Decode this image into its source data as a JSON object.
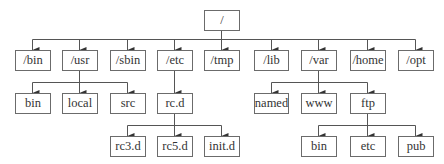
{
  "diagram": {
    "type": "directory-tree",
    "colors": {
      "line": "#555555",
      "border": "#6b6b6b",
      "text": "#333333",
      "background": "#ffffff"
    },
    "root": {
      "label": "/"
    },
    "level1": [
      {
        "id": "bin",
        "label": "/bin"
      },
      {
        "id": "usr",
        "label": "/usr"
      },
      {
        "id": "sbin",
        "label": "/sbin"
      },
      {
        "id": "etc",
        "label": "/etc"
      },
      {
        "id": "tmp",
        "label": "/tmp"
      },
      {
        "id": "lib",
        "label": "/lib"
      },
      {
        "id": "var",
        "label": "/var"
      },
      {
        "id": "home",
        "label": "/home"
      },
      {
        "id": "opt",
        "label": "/opt"
      }
    ],
    "level2": [
      {
        "id": "usr-bin",
        "label": "bin",
        "parent": "/usr"
      },
      {
        "id": "usr-local",
        "label": "local",
        "parent": "/usr"
      },
      {
        "id": "usr-src",
        "label": "src",
        "parent": "/usr"
      },
      {
        "id": "etc-rcd",
        "label": "rc.d",
        "parent": "/etc"
      },
      {
        "id": "var-named",
        "label": "named",
        "parent": "/var"
      },
      {
        "id": "var-www",
        "label": "www",
        "parent": "/var"
      },
      {
        "id": "var-ftp",
        "label": "ftp",
        "parent": "/var"
      }
    ],
    "level3": [
      {
        "id": "rc3d",
        "label": "rc3.d",
        "parent": "rc.d"
      },
      {
        "id": "rc5d",
        "label": "rc5.d",
        "parent": "rc.d"
      },
      {
        "id": "initd",
        "label": "init.d",
        "parent": "rc.d"
      },
      {
        "id": "ftp-bin",
        "label": "bin",
        "parent": "ftp"
      },
      {
        "id": "ftp-etc",
        "label": "etc",
        "parent": "ftp"
      },
      {
        "id": "ftp-pub",
        "label": "pub",
        "parent": "ftp"
      }
    ]
  }
}
